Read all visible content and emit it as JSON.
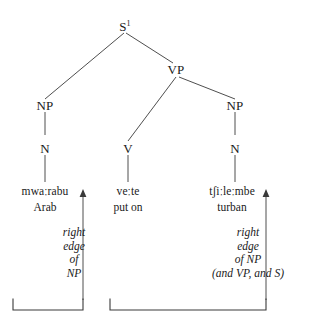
{
  "figure": {
    "type": "syntax-tree-diagram",
    "background_color": "#ffffff",
    "line_color": "#3a3a3a",
    "text_color": "#1a1a1a"
  },
  "tree": {
    "root": {
      "label": "S",
      "superscript": "1"
    },
    "nodes": [
      {
        "id": "s1",
        "label": "S",
        "superscript": "1"
      },
      {
        "id": "vp",
        "label": "VP"
      },
      {
        "id": "np1",
        "label": "NP"
      },
      {
        "id": "np2",
        "label": "NP"
      },
      {
        "id": "n1",
        "label": "N"
      },
      {
        "id": "v",
        "label": "V"
      },
      {
        "id": "n2",
        "label": "N"
      }
    ]
  },
  "lexical_items": [
    {
      "form": "mwaːrabu",
      "gloss": "Arab"
    },
    {
      "form": "veːte",
      "gloss": "put on"
    },
    {
      "form": "tʃiːleːmbe",
      "gloss": "turban"
    }
  ],
  "annotations": {
    "left": {
      "lines": [
        "right",
        "edge",
        "of",
        "NP"
      ]
    },
    "right": {
      "lines": [
        "right",
        "edge",
        "of NP",
        "(and VP, and S)"
      ]
    }
  },
  "brackets": [
    {
      "id": "bracket-left"
    },
    {
      "id": "bracket-right"
    }
  ]
}
